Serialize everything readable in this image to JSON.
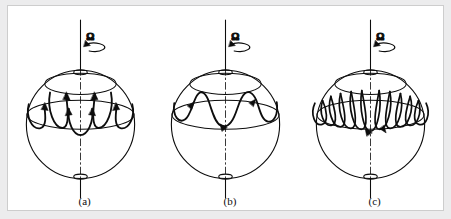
{
  "figure": {
    "domain": "Diagram",
    "background_color": "#ececed",
    "panel_background": "#ffffff",
    "border_color": "#cdcdcd",
    "ink_color": "#0d0d0d",
    "panel_count": 3
  },
  "panels": [
    {
      "id": "panel-a",
      "caption": "(a)",
      "rotation_symbol": "Ω",
      "rotation_arrow": "counterclockwise-ellipse-arrow",
      "pattern_name": "columnar-rolls",
      "loop_count": 4,
      "loop_style": "broad-u-loops",
      "arrowhead_count": 8,
      "north_pole_marker": "ellipse",
      "south_pole_marker": "ellipse"
    },
    {
      "id": "panel-b",
      "caption": "(b)",
      "rotation_symbol": "Ω",
      "rotation_arrow": "counterclockwise-ellipse-arrow",
      "pattern_name": "wavy-band",
      "loop_count": 3,
      "loop_style": "sinusoidal-wave",
      "arrowhead_count": 3,
      "north_pole_marker": "ellipse",
      "south_pole_marker": "ellipse"
    },
    {
      "id": "panel-c",
      "caption": "(c)",
      "rotation_symbol": "Ω",
      "rotation_arrow": "counterclockwise-ellipse-arrow",
      "pattern_name": "tight-spiral-coils",
      "loop_count": 9,
      "loop_style": "narrow-overlapping-loops",
      "arrowhead_count": 2,
      "north_pole_marker": "ellipse",
      "south_pole_marker": "ellipse"
    }
  ],
  "geometry": {
    "sphere_center_x": 75,
    "sphere_center_y": 120,
    "sphere_radius": 56,
    "upper_latitude_ry": 11,
    "lower_latitude_ry": 15,
    "axis_top_y": 12,
    "axis_bottom_y": 196
  }
}
